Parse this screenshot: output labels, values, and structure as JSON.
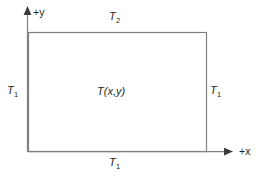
{
  "figure": {
    "name": "rectangular-domain-boundary-conditions",
    "background_color": "#ffffff",
    "line_color": "#808080",
    "text_color": "#231f20"
  },
  "axes": {
    "y_axis": {
      "label": "+y",
      "sign": "+",
      "variable": "y",
      "arrow": "up"
    },
    "x_axis": {
      "label": "+x",
      "sign": "+",
      "variable": "x",
      "arrow": "right"
    }
  },
  "region": {
    "interior_label": {
      "symbol": "T",
      "argument": "(x,y)",
      "full": "T(x,y)"
    }
  },
  "boundary_labels": {
    "top": {
      "symbol": "T",
      "subscript": "2",
      "full": "T2"
    },
    "left": {
      "symbol": "T",
      "subscript": "1",
      "full": "T1"
    },
    "right": {
      "symbol": "T",
      "subscript": "1",
      "full": "T1"
    },
    "bottom": {
      "symbol": "T",
      "subscript": "1",
      "full": "T1"
    }
  }
}
